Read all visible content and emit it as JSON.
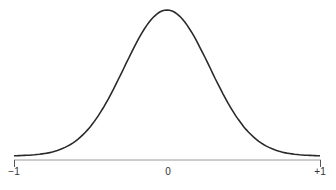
{
  "chart_data": {
    "type": "line",
    "title": "",
    "xlabel": "",
    "ylabel": "",
    "x": [
      -1.0,
      -0.85,
      -0.7,
      -0.55,
      -0.45,
      -0.35,
      -0.25,
      -0.15,
      -0.05,
      0.0,
      0.05,
      0.15,
      0.25,
      0.35,
      0.45,
      0.55,
      0.7,
      0.85,
      1.0
    ],
    "series": [
      {
        "name": "density",
        "values": [
          0.03,
          0.06,
          0.15,
          0.35,
          0.55,
          0.73,
          0.88,
          0.97,
          1.0,
          1.0,
          1.0,
          0.97,
          0.88,
          0.73,
          0.55,
          0.35,
          0.15,
          0.06,
          0.03
        ]
      }
    ],
    "xlim": [
      -1,
      1
    ],
    "ylim": [
      0,
      1
    ],
    "x_tick_labels": [
      "−1",
      "0",
      "+1"
    ],
    "x_ticks": [
      -1,
      0,
      1
    ],
    "grid": false,
    "legend": null,
    "line_color": "#2a2a2a",
    "axis_color": "#888888"
  }
}
